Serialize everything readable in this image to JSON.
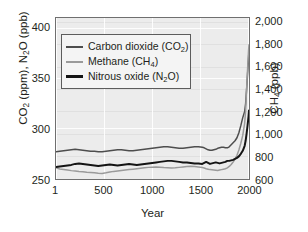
{
  "chart_data": {
    "type": "line",
    "title": "",
    "xlabel": "Year",
    "ylabel_left": "CO2 (ppm), N2O (ppb)",
    "ylabel_right": "CH4 (ppb)",
    "xlim": [
      1,
      2005
    ],
    "ylim_left": [
      250,
      410
    ],
    "ylim_right": [
      600,
      2040
    ],
    "grid": true,
    "legend_position": "upper-left-inside",
    "xticks": [
      1,
      500,
      1000,
      1500,
      2000
    ],
    "xtick_labels": [
      "1",
      "500",
      "1000",
      "1500",
      "2000"
    ],
    "yticks_left": [
      250,
      300,
      350,
      400
    ],
    "ytick_labels_left": [
      "250",
      "300",
      "350",
      "400"
    ],
    "yticks_right": [
      600,
      800,
      1000,
      1200,
      1400,
      1600,
      1800,
      2000
    ],
    "ytick_labels_right": [
      "600",
      "800",
      "1,000",
      "1,200",
      "1,400",
      "1,600",
      "1,800",
      "2,000"
    ],
    "series": [
      {
        "name": "Carbon dioxide (CO2)",
        "legend_label": "Carbon dioxide (CO₂)",
        "axis": "left",
        "units": "ppm",
        "color": "#4d4d4d",
        "x": [
          1,
          40,
          80,
          120,
          160,
          200,
          240,
          280,
          320,
          360,
          400,
          440,
          480,
          520,
          560,
          600,
          640,
          680,
          720,
          760,
          800,
          840,
          880,
          920,
          960,
          1000,
          1040,
          1080,
          1120,
          1160,
          1200,
          1240,
          1280,
          1320,
          1360,
          1400,
          1440,
          1480,
          1520,
          1540,
          1560,
          1580,
          1600,
          1620,
          1640,
          1660,
          1680,
          1700,
          1720,
          1740,
          1760,
          1780,
          1800,
          1820,
          1840,
          1860,
          1880,
          1900,
          1920,
          1940,
          1960,
          1970,
          1980,
          1990,
          2000,
          2005
        ],
        "y": [
          277,
          277.5,
          278,
          278.5,
          279,
          279.5,
          279,
          278.5,
          278,
          277.5,
          277.5,
          277,
          277,
          277.5,
          278,
          278.5,
          279,
          279,
          278.5,
          278,
          278,
          278.5,
          279,
          279.5,
          280,
          280.5,
          281,
          281.5,
          282,
          282,
          281.5,
          281,
          280.5,
          280.5,
          281,
          281.5,
          282,
          282,
          281.5,
          281,
          280,
          279,
          278.5,
          278.5,
          279,
          279.5,
          280.5,
          281,
          281.5,
          281.5,
          281,
          281,
          282,
          284,
          286,
          288,
          291,
          296,
          303,
          311,
          317,
          325,
          339,
          354,
          369,
          379
        ]
      },
      {
        "name": "Methane (CH4)",
        "legend_label": "Methane (CH₄)",
        "axis": "right",
        "units": "ppb",
        "color": "#9a9a9a",
        "x": [
          1,
          40,
          80,
          120,
          160,
          200,
          240,
          280,
          320,
          360,
          400,
          440,
          480,
          520,
          560,
          600,
          640,
          680,
          720,
          760,
          800,
          840,
          880,
          920,
          960,
          1000,
          1040,
          1080,
          1120,
          1160,
          1200,
          1240,
          1280,
          1320,
          1360,
          1400,
          1440,
          1480,
          1520,
          1540,
          1560,
          1580,
          1600,
          1620,
          1640,
          1660,
          1680,
          1700,
          1720,
          1740,
          1760,
          1780,
          1800,
          1820,
          1840,
          1860,
          1880,
          1900,
          1920,
          1940,
          1960,
          1970,
          1980,
          1990,
          2000,
          2005
        ],
        "y": [
          700,
          690,
          685,
          680,
          675,
          672,
          668,
          665,
          660,
          658,
          655,
          652,
          650,
          655,
          662,
          668,
          672,
          676,
          680,
          684,
          688,
          692,
          696,
          700,
          704,
          706,
          708,
          706,
          702,
          700,
          698,
          700,
          704,
          708,
          712,
          714,
          712,
          708,
          702,
          698,
          692,
          688,
          684,
          682,
          680,
          678,
          676,
          680,
          684,
          688,
          692,
          700,
          712,
          730,
          752,
          778,
          812,
          860,
          920,
          990,
          1100,
          1210,
          1400,
          1580,
          1745,
          1800
        ]
      },
      {
        "name": "Nitrous oxide (N2O)",
        "legend_label": "Nitrous oxide (N₂O)",
        "axis": "left",
        "units": "ppb",
        "color": "#141414",
        "x": [
          1,
          40,
          80,
          120,
          160,
          200,
          240,
          280,
          320,
          360,
          400,
          440,
          480,
          520,
          560,
          600,
          640,
          680,
          720,
          760,
          800,
          840,
          880,
          920,
          960,
          1000,
          1040,
          1080,
          1120,
          1160,
          1200,
          1240,
          1280,
          1320,
          1360,
          1400,
          1440,
          1480,
          1520,
          1540,
          1560,
          1580,
          1600,
          1620,
          1640,
          1660,
          1680,
          1700,
          1720,
          1740,
          1760,
          1780,
          1800,
          1820,
          1840,
          1860,
          1880,
          1900,
          1920,
          1940,
          1960,
          1970,
          1980,
          1990,
          2000,
          2005
        ],
        "y": [
          262,
          262.5,
          263,
          263.5,
          264,
          265,
          265.5,
          265,
          264.5,
          264,
          263.5,
          263,
          263.5,
          264,
          264.5,
          264,
          263.5,
          264,
          264.5,
          265,
          264.5,
          264,
          264.5,
          265,
          265.5,
          266,
          266.5,
          267,
          267.5,
          268,
          268,
          267.5,
          267,
          266.5,
          266.5,
          266,
          265.5,
          265.5,
          265,
          266,
          267,
          266,
          265,
          265.5,
          266,
          266.5,
          266,
          265.5,
          266,
          266.5,
          267,
          268,
          268,
          268.5,
          269,
          270,
          271,
          272.5,
          275,
          278,
          283,
          288,
          295,
          303,
          312,
          318
        ]
      }
    ]
  },
  "axes": {
    "left_title_html": "CO<sub>2</sub> (ppm), N<sub>2</sub>O (ppb)",
    "right_title_html": "CH<sub>4</sub> (ppb)",
    "x_title": "Year"
  },
  "legend": {
    "entries": [
      {
        "label_html": "Carbon dioxide (CO<sub>2</sub>)",
        "swatch": "co2"
      },
      {
        "label_html": "Methane (CH<sub>4</sub>)",
        "swatch": "ch4"
      },
      {
        "label_html": "Nitrous oxide (N<sub>2</sub>O)",
        "swatch": "n2o"
      }
    ]
  },
  "colors": {
    "co2": "#4d4d4d",
    "ch4": "#9a9a9a",
    "n2o": "#141414",
    "plot_background": "#ececec",
    "grid": "#ffffff",
    "frame": "#6f6f6f",
    "text": "#231f20",
    "page_background": "#ffffff"
  }
}
